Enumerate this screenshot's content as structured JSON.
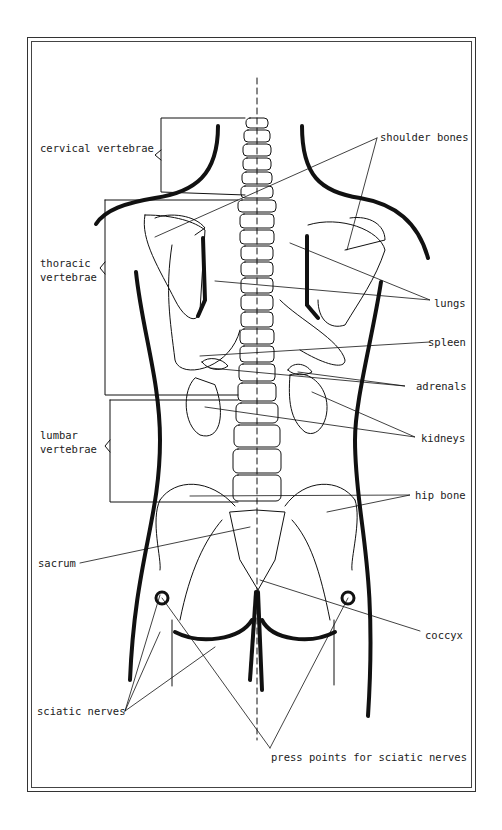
{
  "diagram": {
    "type": "anatomical-back-view",
    "labels": {
      "cervical": "cervical vertebrae",
      "thoracic_1": "thoracic",
      "thoracic_2": "vertebrae",
      "lumbar_1": "lumbar",
      "lumbar_2": "vertebrae",
      "sacrum": "sacrum",
      "sciatic": "sciatic nerves",
      "shoulder": "shoulder bones",
      "lungs": "lungs",
      "spleen": "spleen",
      "adrenals": "adrenals",
      "kidneys": "kidneys",
      "hip": "hip bone",
      "coccyx": "coccyx",
      "press_points": "press points for sciatic nerves"
    }
  }
}
